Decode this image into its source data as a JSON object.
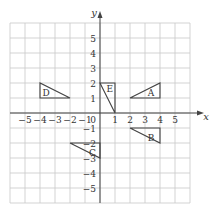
{
  "axes": {
    "x_label": "x",
    "y_label": "y",
    "origin_label": "0",
    "x_ticks": [
      -5,
      -4,
      -3,
      -2,
      -1,
      1,
      2,
      3,
      4,
      5
    ],
    "y_ticks": [
      -5,
      -4,
      -3,
      -2,
      -1,
      1,
      2,
      3,
      4,
      5
    ],
    "grid_range": {
      "xmin": -6,
      "xmax": 6,
      "ymin": -6,
      "ymax": 6
    }
  },
  "shapes": [
    {
      "label": "A",
      "vertices": [
        [
          2,
          1
        ],
        [
          4,
          1
        ],
        [
          4,
          2
        ]
      ],
      "label_pos": [
        3.4,
        1.35
      ]
    },
    {
      "label": "B",
      "vertices": [
        [
          2,
          -1
        ],
        [
          4,
          -1
        ],
        [
          4,
          -2
        ]
      ],
      "label_pos": [
        3.4,
        -1.65
      ]
    },
    {
      "label": "C",
      "vertices": [
        [
          -2,
          -2
        ],
        [
          0,
          -2
        ],
        [
          0,
          -3
        ]
      ],
      "label_pos": [
        -0.5,
        -2.65
      ]
    },
    {
      "label": "D",
      "vertices": [
        [
          -4,
          2
        ],
        [
          -4,
          1
        ],
        [
          -2,
          1
        ]
      ],
      "label_pos": [
        -3.6,
        1.35
      ]
    },
    {
      "label": "E",
      "vertices": [
        [
          0,
          2
        ],
        [
          1,
          2
        ],
        [
          1,
          0
        ]
      ],
      "label_pos": [
        0.65,
        1.65
      ]
    }
  ],
  "colors": {
    "grid": "#c8c8c8",
    "axis": "#444444",
    "shape": "#444444",
    "text": "#333333"
  }
}
